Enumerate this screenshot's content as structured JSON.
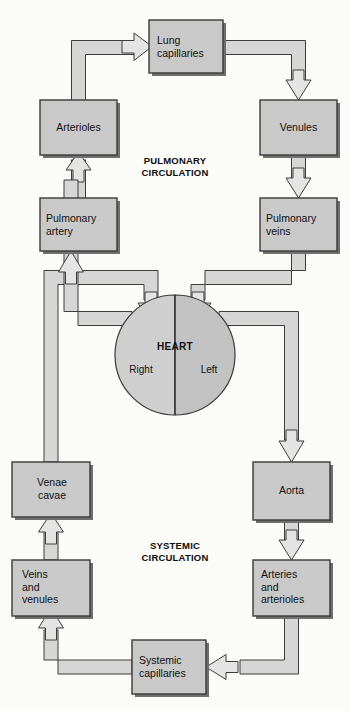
{
  "diagram": {
    "background_color": "#fbfbf8",
    "box_fill": "#c9c9c9",
    "pipe_fill": "#d4d4d4",
    "heart_right_fill": "#cfcfcf",
    "heart_left_fill": "#c2c2c2",
    "stroke_color": "#3a3a3a"
  },
  "sections": [
    {
      "id": "pulmonary",
      "label": "PULMONARY\nCIRCULATION",
      "x": 175,
      "y": 161
    },
    {
      "id": "systemic",
      "label": "SYSTEMIC\nCIRCULATION",
      "x": 175,
      "y": 546
    }
  ],
  "heart": {
    "name": "HEART",
    "right_label": "Right",
    "left_label": "Left",
    "cx": 175,
    "cy": 355,
    "r": 60
  },
  "boxes": [
    {
      "id": "lung-capillaries",
      "label": "Lung\ncapillaries",
      "x": 149,
      "y": 20,
      "w": 74,
      "h": 53
    },
    {
      "id": "arterioles",
      "label": "Arterioles",
      "x": 40,
      "y": 100,
      "w": 77,
      "h": 55
    },
    {
      "id": "venules",
      "label": "Venules",
      "x": 260,
      "y": 100,
      "w": 77,
      "h": 55
    },
    {
      "id": "pulmonary-artery",
      "label": "Pulmonary\nartery",
      "x": 40,
      "y": 198,
      "w": 77,
      "h": 53
    },
    {
      "id": "pulmonary-veins",
      "label": "Pulmonary\nveins",
      "x": 260,
      "y": 198,
      "w": 77,
      "h": 53
    },
    {
      "id": "venae-cavae",
      "label": "Venae\ncavae",
      "x": 12,
      "y": 462,
      "w": 78,
      "h": 55
    },
    {
      "id": "aorta",
      "label": "Aorta",
      "x": 253,
      "y": 462,
      "w": 77,
      "h": 58
    },
    {
      "id": "veins-and-venules",
      "label": "Veins\nand\nvenules",
      "x": 12,
      "y": 560,
      "w": 78,
      "h": 56
    },
    {
      "id": "arteries-arterioles",
      "label": "Arteries\nand\narterioles",
      "x": 253,
      "y": 560,
      "w": 77,
      "h": 56
    },
    {
      "id": "systemic-capillaries",
      "label": "Systemic\ncapillaries",
      "x": 132,
      "y": 640,
      "w": 74,
      "h": 54
    }
  ],
  "flows": [
    {
      "from": "pulmonary-artery",
      "to": "arterioles",
      "direction": "up"
    },
    {
      "from": "arterioles",
      "to": "lung-capillaries",
      "direction": "right"
    },
    {
      "from": "lung-capillaries",
      "to": "venules",
      "direction": "down"
    },
    {
      "from": "venules",
      "to": "pulmonary-veins",
      "direction": "down"
    },
    {
      "from": "pulmonary-veins",
      "to": "heart-left",
      "direction": "down"
    },
    {
      "from": "heart-left",
      "to": "aorta",
      "direction": "down"
    },
    {
      "from": "aorta",
      "to": "arteries-arterioles",
      "direction": "down"
    },
    {
      "from": "arteries-arterioles",
      "to": "systemic-capillaries",
      "direction": "left"
    },
    {
      "from": "systemic-capillaries",
      "to": "veins-and-venules",
      "direction": "up"
    },
    {
      "from": "veins-and-venules",
      "to": "venae-cavae",
      "direction": "up"
    },
    {
      "from": "venae-cavae",
      "to": "heart-right",
      "direction": "down"
    },
    {
      "from": "heart-right",
      "to": "pulmonary-artery",
      "direction": "up"
    }
  ]
}
